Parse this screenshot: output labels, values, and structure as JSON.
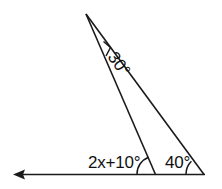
{
  "diagram": {
    "background_color": "#ffffff",
    "stroke_color": "#1a1a1a",
    "text_color": "#111111",
    "labels": {
      "apex_angle": "30°",
      "exterior_angle": "2x+10°",
      "right_base_angle": "40°"
    },
    "icons": {
      "left_arrow": "left-arrowhead",
      "apex_tick": "angle-tick-mark",
      "arc_middle": "angle-arc",
      "arc_right": "angle-arc"
    },
    "points": {
      "apex": "86,14",
      "middle_vertex": "155,174",
      "right_vertex": "204,174",
      "ray_left_end": "14,174"
    }
  }
}
